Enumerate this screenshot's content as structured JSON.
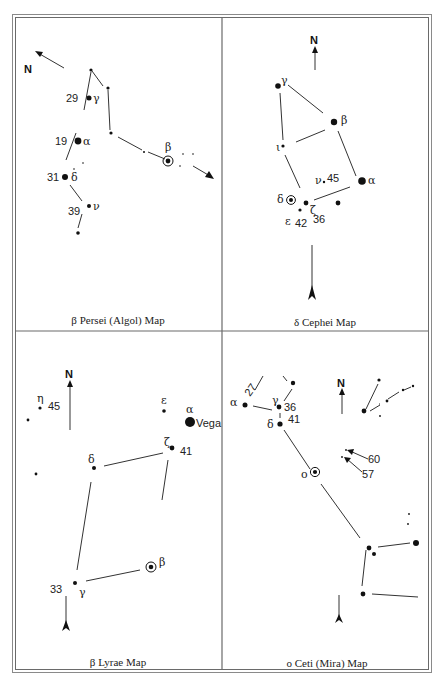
{
  "page": {
    "title_visible": "cropped heading (illegible, only lower part of letters visible)"
  },
  "panels": [
    {
      "caption": "β Persei (Algol) Map",
      "north_label": "N",
      "stars": [
        {
          "greek": "γ",
          "number": "29"
        },
        {
          "greek": "α",
          "number": "19"
        },
        {
          "greek": "δ",
          "number": "31"
        },
        {
          "greek": "ν",
          "number": "39"
        },
        {
          "greek": "β",
          "number": "",
          "variable": true
        }
      ]
    },
    {
      "caption": "δ Cephei Map",
      "north_label": "N",
      "stars": [
        {
          "greek": "γ",
          "number": ""
        },
        {
          "greek": "β",
          "number": ""
        },
        {
          "greek": "ι",
          "number": ""
        },
        {
          "greek": "ν",
          "number": "45"
        },
        {
          "greek": "α",
          "number": ""
        },
        {
          "greek": "δ",
          "number": "",
          "variable": true
        },
        {
          "greek": "ε",
          "number": "42"
        },
        {
          "greek": "ζ",
          "number": "36"
        }
      ]
    },
    {
      "caption": "β Lyrae Map",
      "north_label": "N",
      "stars": [
        {
          "greek": "η",
          "number": "45"
        },
        {
          "greek": "ε",
          "number": ""
        },
        {
          "greek": "α",
          "number": "",
          "name": "Vega"
        },
        {
          "greek": "ζ",
          "number": "41"
        },
        {
          "greek": "δ",
          "number": ""
        },
        {
          "greek": "β",
          "number": "",
          "variable": true
        },
        {
          "greek": "γ",
          "number": "33"
        }
      ]
    },
    {
      "caption": "o Ceti (Mira) Map",
      "north_label": "N",
      "stars": [
        {
          "greek": "α",
          "number": "27"
        },
        {
          "greek": "γ",
          "number": "36"
        },
        {
          "greek": "δ",
          "number": "41"
        },
        {
          "greek": "o",
          "number": "",
          "variable": true
        },
        {
          "greek": "",
          "number": "60"
        },
        {
          "greek": "",
          "number": "57"
        }
      ]
    }
  ]
}
